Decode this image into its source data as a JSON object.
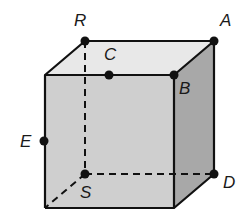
{
  "diagram": {
    "colors": {
      "top_face": "#e8e8e8",
      "front_face": "#cfcfcf",
      "right_face": "#a8a8a8",
      "edge": "#111111",
      "point": "#111111"
    },
    "vertices": {
      "front_top_left": [
        45,
        75
      ],
      "front_top_right": [
        174,
        75
      ],
      "front_bottom_left": [
        45,
        208
      ],
      "front_bottom_right": [
        174,
        208
      ],
      "back_top_left": [
        85,
        41
      ],
      "back_top_right": [
        214,
        41
      ],
      "back_bottom_left": [
        85,
        174
      ],
      "back_bottom_right": [
        214,
        174
      ]
    },
    "points": [
      {
        "label": "R",
        "x": 85,
        "y": 41,
        "label_x": 74,
        "label_y": 26
      },
      {
        "label": "A",
        "x": 214,
        "y": 41,
        "label_x": 220,
        "label_y": 26
      },
      {
        "label": "C",
        "x": 109,
        "y": 75,
        "label_x": 104,
        "label_y": 60
      },
      {
        "label": "B",
        "x": 174,
        "y": 75,
        "label_x": 179,
        "label_y": 94
      },
      {
        "label": "E",
        "x": 44,
        "y": 141,
        "label_x": 20,
        "label_y": 147
      },
      {
        "label": "S",
        "x": 85,
        "y": 174,
        "label_x": 80,
        "label_y": 198
      },
      {
        "label": "D",
        "x": 214,
        "y": 174,
        "label_x": 223,
        "label_y": 188
      }
    ]
  }
}
